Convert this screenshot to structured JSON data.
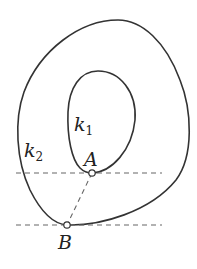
{
  "diagram": {
    "curves": [
      {
        "id": "k2",
        "label_main": "k",
        "label_sub": "2",
        "description": "outer closed curve"
      },
      {
        "id": "k1",
        "label_main": "k",
        "label_sub": "1",
        "description": "inner closed curve"
      }
    ],
    "points": [
      {
        "id": "A",
        "label": "A",
        "on_curve": "k1"
      },
      {
        "id": "B",
        "label": "B",
        "on_curve": "k2"
      }
    ],
    "lines": [
      {
        "id": "tangent-A",
        "style": "dashed",
        "orientation": "horizontal",
        "through": "A"
      },
      {
        "id": "tangent-B",
        "style": "dashed",
        "orientation": "horizontal",
        "through": "B"
      },
      {
        "id": "segment-AB",
        "style": "dashed",
        "from": "A",
        "to": "B"
      }
    ],
    "colors": {
      "stroke": "#333333",
      "dash": "#666666",
      "background": "#ffffff"
    }
  }
}
